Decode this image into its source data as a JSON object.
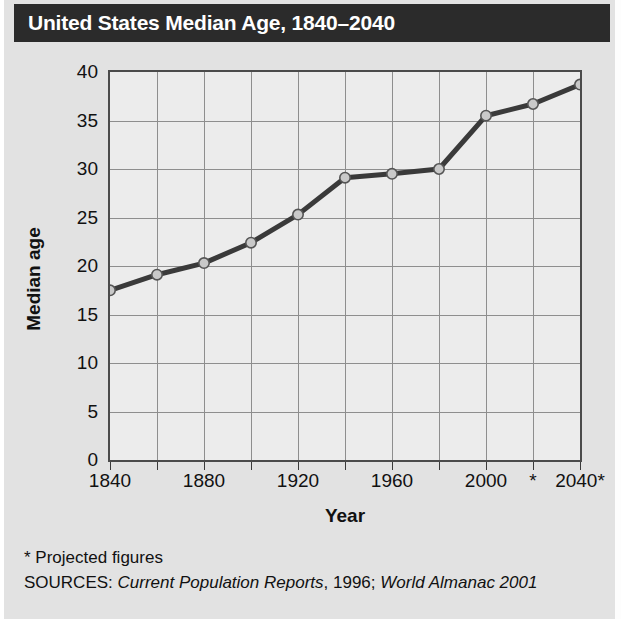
{
  "title": "United States Median Age, 1840–2040",
  "axes": {
    "y_title": "Median age",
    "x_title": "Year"
  },
  "footnotes": {
    "projected": "* Projected figures",
    "sources_prefix": "SOURCES: ",
    "sources_italic_1": "Current Population Reports",
    "sources_mid": ", 1996; ",
    "sources_italic_2": "World Almanac 2001"
  },
  "colors": {
    "title_bar": "#2b2b2b",
    "title_text": "#ffffff",
    "page_background": "#e2e2e2",
    "plot_background": "#ececec",
    "gridline": "#8e8e8e",
    "axis_border": "#4b4b4b",
    "line": "#3a3a3a",
    "marker_fill": "#c9c9c9",
    "marker_stroke": "#555555",
    "text": "#111111"
  },
  "chart_data": {
    "type": "line",
    "title": "United States Median Age, 1840–2040",
    "xlabel": "Year",
    "ylabel": "Median age",
    "xlim": [
      1840,
      2040
    ],
    "ylim": [
      0,
      40
    ],
    "ytick_values": [
      0,
      5,
      10,
      15,
      20,
      25,
      30,
      35,
      40
    ],
    "ytick_labels": [
      "0",
      "5",
      "10",
      "15",
      "20",
      "25",
      "30",
      "35",
      "40"
    ],
    "xtick_values": [
      1840,
      1860,
      1880,
      1900,
      1920,
      1940,
      1960,
      1980,
      2000,
      2020,
      2040
    ],
    "xtick_labels": [
      "1840",
      "",
      "1880",
      "",
      "1920",
      "",
      "1960",
      "",
      "2000",
      "*",
      "2040*"
    ],
    "grid": true,
    "legend": "none",
    "markers": true,
    "series": [
      {
        "name": "Median age",
        "x": [
          1840,
          1860,
          1880,
          1900,
          1920,
          1940,
          1960,
          1980,
          2000,
          2020,
          2040
        ],
        "values": [
          17.5,
          19.1,
          20.3,
          22.4,
          25.3,
          29.1,
          29.5,
          30.0,
          35.5,
          36.7,
          38.7
        ]
      }
    ],
    "annotations": [
      "* Projected figures",
      "SOURCES: Current Population Reports, 1996; World Almanac 2001"
    ]
  }
}
